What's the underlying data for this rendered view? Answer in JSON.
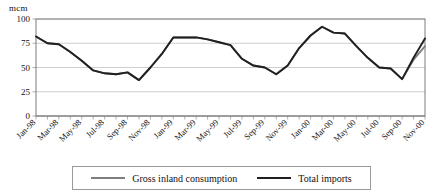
{
  "chart_data": {
    "type": "line",
    "title": "",
    "xlabel": "",
    "ylabel": "mcm",
    "ylim": [
      0,
      100
    ],
    "yticks": [
      0,
      25,
      50,
      75,
      100
    ],
    "grid": true,
    "legend_position": "bottom",
    "x_tick_labels": [
      "Jan-98",
      "Mar-98",
      "May-98",
      "Jul-98",
      "Sep-98",
      "Nov-98",
      "Jan-99",
      "Mar-99",
      "May-99",
      "Jul-99",
      "Sep-99",
      "Nov-99",
      "Jan-00",
      "Mar-00",
      "May-00",
      "Jul-00",
      "Sep-00",
      "Nov-00"
    ],
    "x": [
      "Jan-98",
      "Feb-98",
      "Mar-98",
      "Apr-98",
      "May-98",
      "Jun-98",
      "Jul-98",
      "Aug-98",
      "Sep-98",
      "Oct-98",
      "Nov-98",
      "Dec-98",
      "Jan-99",
      "Feb-99",
      "Mar-99",
      "Apr-99",
      "May-99",
      "Jun-99",
      "Jul-99",
      "Aug-99",
      "Sep-99",
      "Oct-99",
      "Nov-99",
      "Dec-99",
      "Jan-00",
      "Feb-00",
      "Mar-00",
      "Apr-00",
      "May-00",
      "Jun-00",
      "Jul-00",
      "Aug-00",
      "Sep-00",
      "Oct-00",
      "Nov-00"
    ],
    "series": [
      {
        "name": "Gross inland consumption",
        "color": "#7e7e7e",
        "values": [
          82,
          75,
          74,
          66,
          57,
          47,
          44,
          43,
          45,
          37,
          50,
          64,
          81,
          81,
          81,
          79,
          76,
          73,
          59,
          52,
          50,
          43,
          52,
          70,
          83,
          92,
          86,
          85,
          72,
          60,
          50,
          49,
          38,
          58,
          72
        ]
      },
      {
        "name": "Total imports",
        "color": "#231f20",
        "values": [
          82,
          75,
          74,
          66,
          57,
          47,
          44,
          43,
          45,
          37,
          50,
          64,
          81,
          81,
          81,
          79,
          76,
          73,
          59,
          52,
          50,
          43,
          52,
          70,
          83,
          92,
          86,
          85,
          72,
          60,
          50,
          49,
          38,
          60,
          80
        ]
      }
    ]
  },
  "legend": {
    "entries": [
      {
        "label": "Gross inland consumption",
        "swatch": "grey-line-swatch"
      },
      {
        "label": "Total imports",
        "swatch": "black-line-swatch"
      }
    ]
  },
  "axis": {
    "unit_label": "mcm"
  }
}
